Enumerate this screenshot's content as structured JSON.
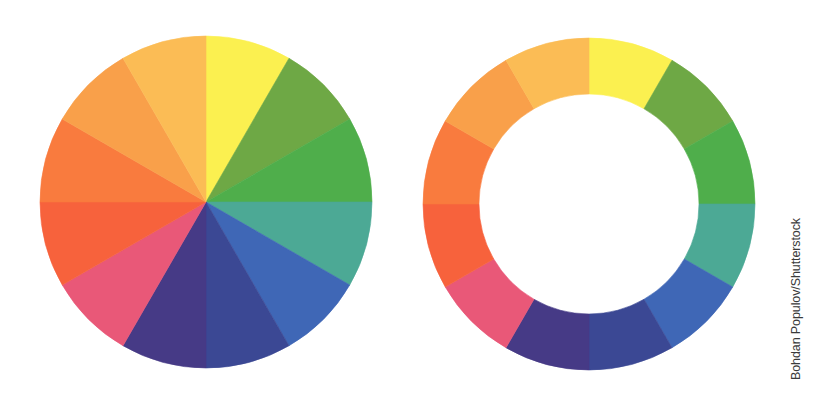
{
  "wheels": [
    {
      "name": "solid-color-wheel",
      "style": "pie"
    },
    {
      "name": "ring-color-wheel",
      "style": "ring"
    }
  ],
  "segments": [
    {
      "name": "yellow",
      "color": "#fbf050"
    },
    {
      "name": "yellow-green",
      "color": "#6ea845"
    },
    {
      "name": "green",
      "color": "#4fae4b"
    },
    {
      "name": "blue-green",
      "color": "#4ca995"
    },
    {
      "name": "blue",
      "color": "#3f67b6"
    },
    {
      "name": "blue-violet",
      "color": "#3b4894"
    },
    {
      "name": "violet",
      "color": "#463a86"
    },
    {
      "name": "red-violet",
      "color": "#e95878"
    },
    {
      "name": "red",
      "color": "#f7623c"
    },
    {
      "name": "red-orange",
      "color": "#f97b3e"
    },
    {
      "name": "orange",
      "color": "#f9a04a"
    },
    {
      "name": "yellow-orange",
      "color": "#fbbc55"
    }
  ],
  "credit": "Bohdan Populov/Shutterstock"
}
